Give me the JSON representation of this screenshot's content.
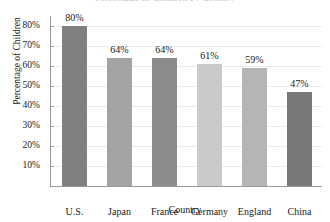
{
  "chart_data": {
    "type": "bar",
    "title": "Percentage of Children by Country",
    "xlabel": "Country",
    "ylabel": "Percentage of Children",
    "categories": [
      "U.S.",
      "Japan",
      "France",
      "Germany",
      "England",
      "China"
    ],
    "values": [
      80,
      64,
      64,
      61,
      59,
      47
    ],
    "value_labels": [
      "80%",
      "64%",
      "64%",
      "61%",
      "59%",
      "47%"
    ],
    "ylim": [
      0,
      85
    ],
    "ytick_values": [
      10,
      20,
      30,
      40,
      50,
      60,
      70,
      80
    ],
    "ytick_labels": [
      "10%",
      "20%",
      "30%",
      "40%",
      "50%",
      "60%",
      "70%",
      "80%"
    ],
    "grid": true,
    "legend": "none",
    "bar_colors": [
      "#808080",
      "#a3a3a3",
      "#8c8c8c",
      "#cacaca",
      "#b5b5b5",
      "#787878"
    ],
    "grid_color": "#e9ecef",
    "axis_color": "#9a9a9a",
    "text_color": "#1a1a1a"
  }
}
